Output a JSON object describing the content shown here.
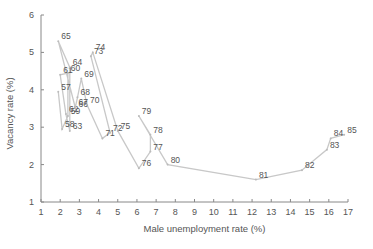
{
  "chart_data": {
    "type": "line",
    "title": "",
    "xlabel": "Male unemployment rate (%)",
    "ylabel": "Vacancy rate (%)",
    "xlim": [
      1,
      17
    ],
    "ylim": [
      1,
      6
    ],
    "xticks": [
      1,
      2,
      3,
      4,
      5,
      6,
      7,
      8,
      9,
      10,
      11,
      12,
      13,
      14,
      15,
      16,
      17
    ],
    "yticks": [
      1,
      2,
      3,
      4,
      5,
      6
    ],
    "grid": false,
    "legend": null,
    "line_color": "#c8c8c8",
    "points": [
      {
        "label": "57",
        "x": 1.9,
        "y": 3.95
      },
      {
        "label": "58",
        "x": 2.1,
        "y": 2.95
      },
      {
        "label": "59",
        "x": 2.4,
        "y": 3.3
      },
      {
        "label": "60",
        "x": 2.4,
        "y": 4.45
      },
      {
        "label": "61",
        "x": 2.0,
        "y": 4.4
      },
      {
        "label": "62",
        "x": 2.3,
        "y": 3.35
      },
      {
        "label": "63",
        "x": 2.5,
        "y": 2.9
      },
      {
        "label": "64",
        "x": 2.5,
        "y": 4.6
      },
      {
        "label": "65",
        "x": 1.9,
        "y": 5.3
      },
      {
        "label": "66",
        "x": 2.8,
        "y": 3.5
      },
      {
        "label": "67",
        "x": 2.8,
        "y": 3.55
      },
      {
        "label": "68",
        "x": 2.9,
        "y": 3.8
      },
      {
        "label": "69",
        "x": 3.1,
        "y": 4.3
      },
      {
        "label": "70",
        "x": 3.4,
        "y": 3.6
      },
      {
        "label": "71",
        "x": 4.2,
        "y": 2.7
      },
      {
        "label": "72",
        "x": 4.6,
        "y": 2.85
      },
      {
        "label": "73",
        "x": 3.6,
        "y": 4.9
      },
      {
        "label": "74",
        "x": 3.7,
        "y": 5.0
      },
      {
        "label": "75",
        "x": 5.0,
        "y": 2.9
      },
      {
        "label": "76",
        "x": 6.1,
        "y": 1.9
      },
      {
        "label": "77",
        "x": 6.7,
        "y": 2.35
      },
      {
        "label": "78",
        "x": 6.7,
        "y": 2.8
      },
      {
        "label": "79",
        "x": 6.1,
        "y": 3.3
      },
      {
        "label": "80",
        "x": 7.6,
        "y": 2.0
      },
      {
        "label": "81",
        "x": 12.2,
        "y": 1.6
      },
      {
        "label": "82",
        "x": 14.6,
        "y": 1.85
      },
      {
        "label": "83",
        "x": 15.9,
        "y": 2.4
      },
      {
        "label": "84",
        "x": 16.1,
        "y": 2.7
      },
      {
        "label": "85",
        "x": 16.8,
        "y": 2.8
      }
    ]
  }
}
